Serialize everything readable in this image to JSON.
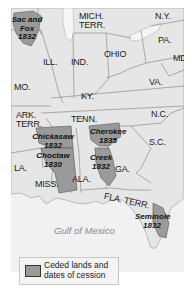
{
  "map": {
    "water_label": "Gulf of Mexico",
    "states": [
      {
        "id": "mich-terr",
        "label": "MICH.\nTERR.",
        "line1": "MICH.",
        "line2": "TERR."
      },
      {
        "id": "ny",
        "label": "N.Y."
      },
      {
        "id": "ill",
        "label": "ILL."
      },
      {
        "id": "ind",
        "label": "IND."
      },
      {
        "id": "ohio",
        "label": "OHIO"
      },
      {
        "id": "pa",
        "label": "PA."
      },
      {
        "id": "md",
        "label": "MD."
      },
      {
        "id": "mo",
        "label": "MO."
      },
      {
        "id": "va",
        "label": "VA."
      },
      {
        "id": "ky",
        "label": "KY."
      },
      {
        "id": "ark-terr",
        "line1": "ARK.",
        "line2": "TERR."
      },
      {
        "id": "tenn",
        "label": "TENN."
      },
      {
        "id": "nc",
        "label": "N.C."
      },
      {
        "id": "sc",
        "label": "S.C."
      },
      {
        "id": "la",
        "label": "LA."
      },
      {
        "id": "miss",
        "label": "MISS."
      },
      {
        "id": "ala",
        "label": "ALA."
      },
      {
        "id": "ga",
        "label": "GA."
      },
      {
        "id": "fla-terr",
        "label": "FLA. TERR."
      }
    ],
    "cessions": [
      {
        "name": "Sac and",
        "name2": "Fox",
        "year": "1832"
      },
      {
        "name": "Chickasaw",
        "year": "1832"
      },
      {
        "name": "Choctaw",
        "year": "1830"
      },
      {
        "name": "Cherokee",
        "year": "1835"
      },
      {
        "name": "Creek",
        "year": "1832"
      },
      {
        "name": "Seminole",
        "year": "1832"
      }
    ],
    "colors": {
      "land": "#e6e6e6",
      "water": "#f1f1f1",
      "ceded": "#9a9a9a",
      "border": "#8c8c8c"
    }
  },
  "legend": {
    "line1": "Ceded lands and",
    "line2": "dates of cession"
  }
}
